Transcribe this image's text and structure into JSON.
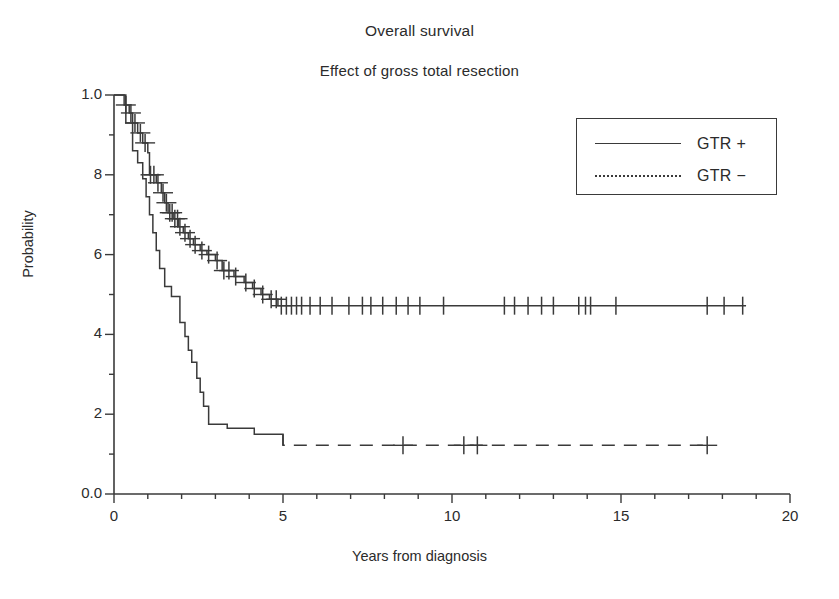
{
  "chart_data": {
    "type": "line",
    "title": "Overall survival",
    "subtitle": "Effect of gross total resection",
    "xlabel": "Years from diagnosis",
    "ylabel": "Probability",
    "xlim": [
      0,
      20
    ],
    "ylim": [
      0.0,
      1.0
    ],
    "xticks": [
      0,
      5,
      10,
      15,
      20
    ],
    "xtick_labels": [
      "0",
      "5",
      "10",
      "15",
      "20"
    ],
    "xtick_minor_step": 1,
    "yticks": [
      0.0,
      0.2,
      0.4,
      0.6,
      0.8,
      1.0
    ],
    "ytick_labels": [
      "0.0",
      "2",
      "4",
      "6",
      "8",
      "1.0"
    ],
    "ytick_minor_step": 0.1,
    "grid": false,
    "legend_position": "upper right",
    "plot_style": "kaplan-meier-step",
    "series": [
      {
        "name": "GTR +",
        "linestyle": "solid",
        "color": "#3a3a3a",
        "steps": [
          [
            0.0,
            1.0
          ],
          [
            0.3,
            1.0
          ],
          [
            0.3,
            0.975
          ],
          [
            0.45,
            0.975
          ],
          [
            0.45,
            0.955
          ],
          [
            0.55,
            0.955
          ],
          [
            0.55,
            0.93
          ],
          [
            0.7,
            0.93
          ],
          [
            0.7,
            0.905
          ],
          [
            0.85,
            0.905
          ],
          [
            0.85,
            0.88
          ],
          [
            1.0,
            0.88
          ],
          [
            1.0,
            0.855
          ],
          [
            1.05,
            0.855
          ],
          [
            1.05,
            0.8
          ],
          [
            1.25,
            0.8
          ],
          [
            1.25,
            0.78
          ],
          [
            1.4,
            0.78
          ],
          [
            1.4,
            0.755
          ],
          [
            1.5,
            0.755
          ],
          [
            1.5,
            0.73
          ],
          [
            1.6,
            0.73
          ],
          [
            1.6,
            0.705
          ],
          [
            1.75,
            0.705
          ],
          [
            1.75,
            0.69
          ],
          [
            1.9,
            0.69
          ],
          [
            1.9,
            0.67
          ],
          [
            2.05,
            0.67
          ],
          [
            2.05,
            0.655
          ],
          [
            2.2,
            0.655
          ],
          [
            2.2,
            0.64
          ],
          [
            2.35,
            0.64
          ],
          [
            2.35,
            0.625
          ],
          [
            2.55,
            0.625
          ],
          [
            2.55,
            0.61
          ],
          [
            2.75,
            0.61
          ],
          [
            2.75,
            0.6
          ],
          [
            3.0,
            0.6
          ],
          [
            3.0,
            0.585
          ],
          [
            3.2,
            0.585
          ],
          [
            3.2,
            0.56
          ],
          [
            3.55,
            0.56
          ],
          [
            3.55,
            0.545
          ],
          [
            3.85,
            0.545
          ],
          [
            3.85,
            0.53
          ],
          [
            4.1,
            0.53
          ],
          [
            4.1,
            0.515
          ],
          [
            4.35,
            0.515
          ],
          [
            4.35,
            0.5
          ],
          [
            4.6,
            0.5
          ],
          [
            4.6,
            0.488
          ],
          [
            4.85,
            0.488
          ],
          [
            4.85,
            0.472
          ],
          [
            18.7,
            0.472
          ]
        ],
        "censor_marks": [
          0.35,
          0.5,
          0.62,
          0.78,
          0.92,
          1.08,
          1.18,
          1.3,
          1.45,
          1.55,
          1.65,
          1.72,
          1.8,
          1.88,
          1.95,
          2.1,
          2.25,
          2.4,
          2.6,
          2.8,
          3.05,
          3.25,
          3.4,
          3.6,
          3.9,
          4.15,
          4.4,
          4.65,
          4.8,
          4.95,
          5.1,
          5.25,
          5.4,
          5.55,
          5.8,
          6.1,
          6.45,
          6.95,
          7.35,
          7.6,
          7.95,
          8.35,
          8.7,
          9.05,
          9.75,
          11.55,
          11.85,
          12.25,
          12.65,
          13.0,
          13.75,
          13.95,
          14.1,
          14.85,
          17.55,
          18.05,
          18.6
        ]
      },
      {
        "name": "GTR −",
        "linestyle": "solid-then-dashed",
        "color": "#3a3a3a",
        "steps": [
          [
            0.0,
            1.0
          ],
          [
            0.35,
            1.0
          ],
          [
            0.35,
            0.93
          ],
          [
            0.55,
            0.93
          ],
          [
            0.55,
            0.86
          ],
          [
            0.7,
            0.86
          ],
          [
            0.7,
            0.83
          ],
          [
            0.85,
            0.83
          ],
          [
            0.85,
            0.79
          ],
          [
            0.95,
            0.79
          ],
          [
            0.95,
            0.745
          ],
          [
            1.05,
            0.745
          ],
          [
            1.05,
            0.7
          ],
          [
            1.15,
            0.7
          ],
          [
            1.15,
            0.655
          ],
          [
            1.25,
            0.655
          ],
          [
            1.25,
            0.61
          ],
          [
            1.35,
            0.61
          ],
          [
            1.35,
            0.565
          ],
          [
            1.5,
            0.565
          ],
          [
            1.5,
            0.52
          ],
          [
            1.7,
            0.52
          ],
          [
            1.7,
            0.495
          ],
          [
            1.95,
            0.495
          ],
          [
            1.95,
            0.43
          ],
          [
            2.1,
            0.43
          ],
          [
            2.1,
            0.395
          ],
          [
            2.2,
            0.395
          ],
          [
            2.2,
            0.36
          ],
          [
            2.3,
            0.36
          ],
          [
            2.3,
            0.33
          ],
          [
            2.45,
            0.33
          ],
          [
            2.45,
            0.29
          ],
          [
            2.55,
            0.29
          ],
          [
            2.55,
            0.255
          ],
          [
            2.65,
            0.255
          ],
          [
            2.65,
            0.22
          ],
          [
            2.8,
            0.22
          ],
          [
            2.8,
            0.175
          ],
          [
            3.35,
            0.175
          ],
          [
            3.35,
            0.165
          ],
          [
            4.15,
            0.165
          ],
          [
            4.15,
            0.15
          ],
          [
            5.0,
            0.15
          ],
          [
            5.0,
            0.122
          ],
          [
            17.6,
            0.122
          ]
        ],
        "dash_start_x": 5.0,
        "censor_marks": [
          8.55,
          10.35,
          10.75,
          17.55
        ]
      }
    ]
  },
  "legend": {
    "items": [
      {
        "label": "GTR +",
        "style": "solid"
      },
      {
        "label": "GTR −",
        "style": "dotted"
      }
    ]
  }
}
